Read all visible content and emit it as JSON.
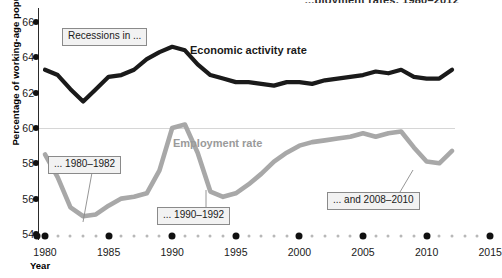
{
  "chart_data": {
    "type": "line",
    "title": "...ployment rates, 1980–2012",
    "xlabel": "Year",
    "ylabel": "Percentage of working-age population",
    "xlim": [
      1979,
      2015
    ],
    "ylim": [
      54,
      66
    ],
    "grid": "single gridline at 60",
    "legend_position": "inline direct labels",
    "x_ticks": [
      1980,
      1985,
      1990,
      1995,
      2000,
      2005,
      2010,
      2015
    ],
    "y_ticks": [
      54,
      56,
      58,
      60,
      62,
      64,
      66
    ],
    "x": [
      1980,
      1981,
      1982,
      1983,
      1984,
      1985,
      1986,
      1987,
      1988,
      1989,
      1990,
      1991,
      1992,
      1993,
      1994,
      1995,
      1996,
      1997,
      1998,
      1999,
      2000,
      2001,
      2002,
      2003,
      2004,
      2005,
      2006,
      2007,
      2008,
      2009,
      2010,
      2011,
      2012
    ],
    "series": [
      {
        "name": "Economic activity rate",
        "color": "#1a1a1a",
        "values": [
          63.3,
          63.0,
          62.2,
          61.5,
          62.2,
          62.9,
          63.0,
          63.3,
          63.9,
          64.3,
          64.6,
          64.4,
          63.6,
          63.0,
          62.8,
          62.6,
          62.6,
          62.5,
          62.4,
          62.6,
          62.6,
          62.5,
          62.7,
          62.8,
          62.9,
          63.0,
          63.2,
          63.1,
          63.3,
          62.9,
          62.8,
          62.8,
          63.3
        ]
      },
      {
        "name": "Employment rate",
        "color": "#a8a8a8",
        "values": [
          58.5,
          57.2,
          55.5,
          55.0,
          55.1,
          55.6,
          56.0,
          56.1,
          56.3,
          57.6,
          60.0,
          60.2,
          58.6,
          56.4,
          56.1,
          56.3,
          56.8,
          57.4,
          58.1,
          58.6,
          59.0,
          59.2,
          59.3,
          59.4,
          59.5,
          59.7,
          59.5,
          59.7,
          59.8,
          58.9,
          58.1,
          58.0,
          58.7
        ]
      }
    ],
    "annotations": [
      {
        "id": "recessions",
        "text": "Recessions in ..."
      },
      {
        "id": "r1980",
        "text": "... 1980–1982"
      },
      {
        "id": "r1990",
        "text": "... 1990–1992"
      },
      {
        "id": "r2008",
        "text": "... and 2008–2010"
      }
    ]
  },
  "axis": {
    "y_title": "Percentage of working-age population",
    "x_title": "Year"
  }
}
